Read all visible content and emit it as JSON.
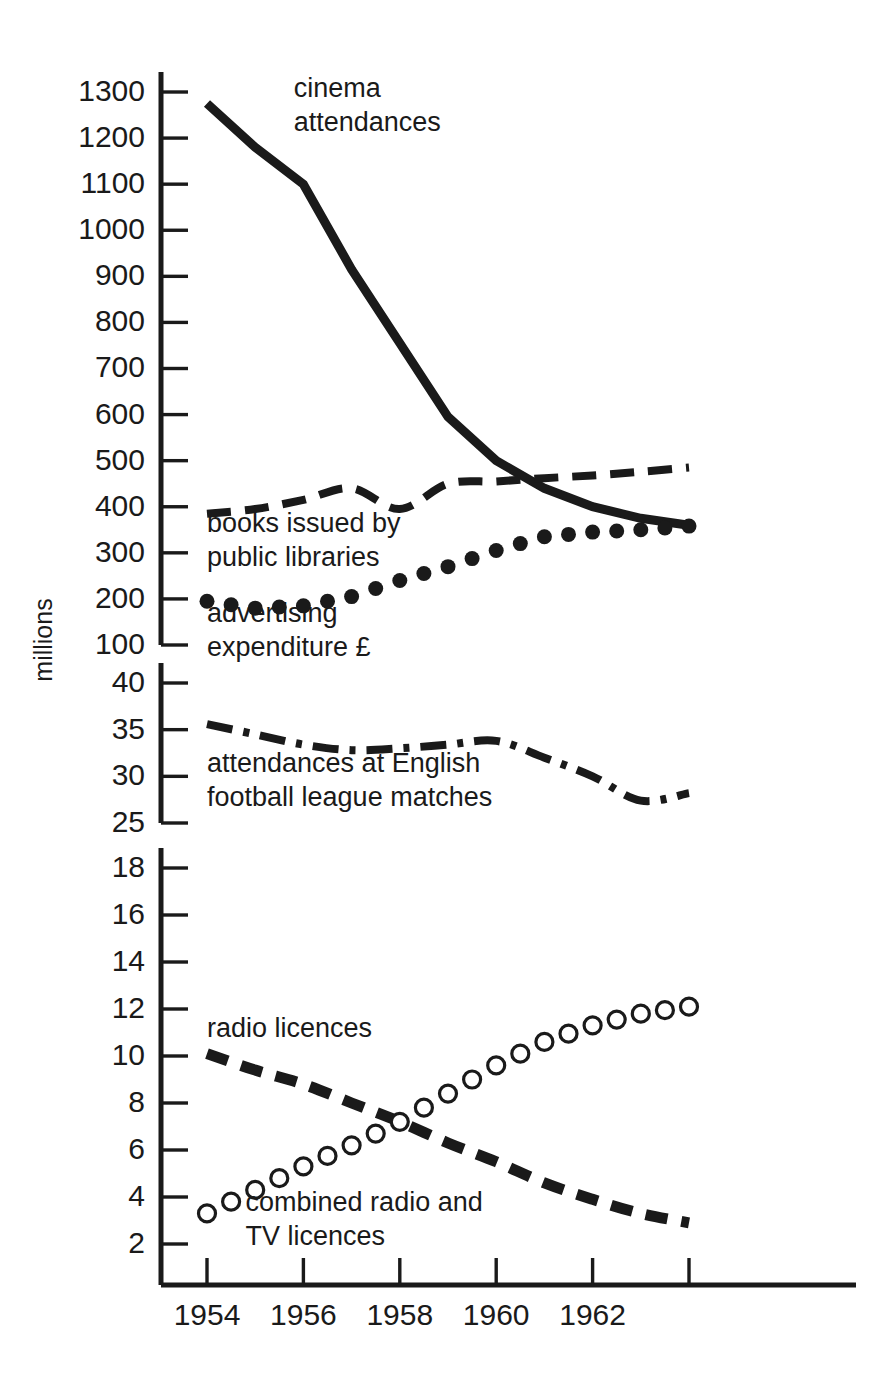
{
  "chart_data": {
    "type": "line",
    "title": "",
    "subtitle": "",
    "xlabel": "",
    "ylabel": "millions",
    "grid": false,
    "legend_position": "inline-annotations",
    "x": [
      1954,
      1955,
      1956,
      1957,
      1958,
      1959,
      1960,
      1961,
      1962,
      1963,
      1964
    ],
    "x_ticks": [
      "1954",
      "1956",
      "1958",
      "1960",
      "1962",
      ""
    ],
    "x_tick_values": [
      1954,
      1956,
      1958,
      1960,
      1962,
      1964
    ],
    "xlim": [
      1953.7,
      1964.5
    ],
    "broken_axis": true,
    "axis_segments": [
      {
        "name": "upper",
        "ticks": [
          1300,
          1200,
          1100,
          1000,
          900,
          800,
          700,
          600,
          500,
          400,
          300,
          200,
          100
        ],
        "tick_labels": [
          "1300",
          "1200",
          "1100",
          "1000",
          "900",
          "800",
          "700",
          "600",
          "500",
          "400",
          "300",
          "200",
          "100"
        ],
        "range": [
          100,
          1300
        ]
      },
      {
        "name": "middle",
        "ticks": [
          40,
          35,
          30,
          25
        ],
        "tick_labels": [
          "40",
          "35",
          "30",
          "25"
        ],
        "range": [
          25,
          40
        ]
      },
      {
        "name": "lower",
        "ticks": [
          18,
          16,
          14,
          12,
          10,
          8,
          6,
          4,
          2
        ],
        "tick_labels": [
          "18",
          "16",
          "14",
          "12",
          "10",
          "8",
          "6",
          "4",
          "2"
        ],
        "range": [
          2,
          18
        ]
      }
    ],
    "series": [
      {
        "name": "cinema attendances",
        "label": "cinema attendances",
        "label_lines": [
          "cinema",
          "attendances"
        ],
        "axis_segment": "upper",
        "style": "solid-thick",
        "marker": "none",
        "values": [
          1275,
          1180,
          1100,
          915,
          755,
          595,
          500,
          440,
          400,
          375,
          360
        ]
      },
      {
        "name": "books issued by public libraries",
        "label": "books issued by public libraries",
        "label_lines": [
          "books issued by",
          "public libraries"
        ],
        "axis_segment": "upper",
        "style": "dashed",
        "marker": "none",
        "values": [
          385,
          395,
          415,
          440,
          395,
          450,
          455,
          462,
          468,
          476,
          485
        ]
      },
      {
        "name": "advertising expenditure £",
        "label": "advertising expenditure £",
        "label_lines": [
          "advertising",
          "expenditure £"
        ],
        "axis_segment": "upper",
        "style": "dotted",
        "marker": "filled-circle",
        "values": [
          195,
          180,
          185,
          205,
          240,
          270,
          305,
          335,
          345,
          350,
          358
        ]
      },
      {
        "name": "attendances at English football league matches",
        "label": "attendances at English football league matches",
        "label_lines": [
          "attendances at English",
          "football league matches"
        ],
        "axis_segment": "middle",
        "style": "dash-dot",
        "marker": "none",
        "values": [
          35.6,
          34.5,
          33.4,
          32.8,
          33.0,
          33.4,
          33.8,
          32.0,
          30.0,
          27.4,
          28.2
        ]
      },
      {
        "name": "radio licences",
        "label": "radio licences",
        "label_lines": [
          "radio licences"
        ],
        "axis_segment": "lower",
        "style": "dashed-thick",
        "marker": "none",
        "values": [
          10.1,
          9.4,
          8.8,
          8.0,
          7.2,
          6.3,
          5.5,
          4.6,
          3.9,
          3.3,
          2.9
        ]
      },
      {
        "name": "combined radio and TV licences",
        "label": "combined radio and TV licences",
        "label_lines": [
          "combined radio and",
          "TV licences"
        ],
        "axis_segment": "lower",
        "style": "markers-only",
        "marker": "open-circle",
        "values": [
          3.3,
          4.3,
          5.3,
          6.2,
          7.2,
          8.4,
          9.6,
          10.6,
          11.3,
          11.8,
          12.1
        ]
      }
    ],
    "annotations": [
      {
        "text": "cinema attendances",
        "x": 1955.8,
        "y_segment": "upper",
        "y": 1290
      },
      {
        "text": "books issued by public libraries",
        "x": 1954.0,
        "y_segment": "upper",
        "y": 345
      },
      {
        "text": "advertising expenditure £",
        "x": 1954.0,
        "y_segment": "upper",
        "y": 150
      },
      {
        "text": "attendances at English football league matches",
        "x": 1954.0,
        "y_segment": "middle",
        "y": 30.5
      },
      {
        "text": "radio licences",
        "x": 1954.0,
        "y_segment": "lower",
        "y": 10.8
      },
      {
        "text": "combined radio and TV licences",
        "x": 1954.8,
        "y_segment": "lower",
        "y": 3.4
      }
    ],
    "colors": {
      "ink": "#1a1a1a",
      "background": "#ffffff"
    }
  }
}
